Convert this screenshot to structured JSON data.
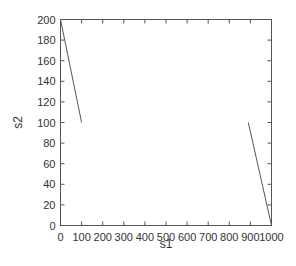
{
  "chart_data": {
    "type": "line",
    "title": "",
    "xlabel": "s1",
    "ylabel": "s2",
    "xlim": [
      0,
      1000
    ],
    "ylim": [
      0,
      200
    ],
    "x_ticks": [
      0,
      100,
      200,
      300,
      400,
      500,
      600,
      700,
      800,
      900,
      1000
    ],
    "y_ticks": [
      0,
      20,
      40,
      60,
      80,
      100,
      120,
      140,
      160,
      180,
      200
    ],
    "grid": false,
    "legend": null,
    "series": [
      {
        "name": "segment-1",
        "x": [
          0,
          100
        ],
        "y": [
          200,
          100
        ],
        "color": "#555555"
      },
      {
        "name": "segment-2",
        "x": [
          890,
          1000
        ],
        "y": [
          100,
          0
        ],
        "color": "#555555"
      }
    ]
  },
  "style": {
    "axis_color": "#555555",
    "line_color": "#555555"
  }
}
